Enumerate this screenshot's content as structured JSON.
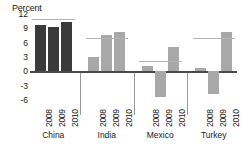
{
  "chart_data": {
    "type": "bar",
    "title": "",
    "ylabel": "Percent",
    "xlabel": "",
    "ylim": [
      -6,
      12
    ],
    "yticks": [
      12,
      9,
      6,
      3,
      0,
      -3,
      -6
    ],
    "grid": false,
    "legend_position": "none",
    "categories": [
      "2008",
      "2009",
      "2010"
    ],
    "groups": [
      {
        "name": "China",
        "color": "#3a3a3a",
        "values": [
          9.6,
          9.2,
          10.4
        ],
        "reference_line": 11.0
      },
      {
        "name": "India",
        "color": "#a8a8a8",
        "values": [
          3.0,
          7.6,
          8.3
        ],
        "reference_line": 7.0
      },
      {
        "name": "Mexico",
        "color": "#a8a8a8",
        "values": [
          1.2,
          -5.3,
          5.0
        ],
        "reference_line": 2.2
      },
      {
        "name": "Turkey",
        "color": "#a8a8a8",
        "values": [
          0.7,
          -4.7,
          8.2
        ],
        "reference_line": 7.0
      }
    ],
    "colors": {
      "highlight_bar": "#3a3a3a",
      "standard_bar": "#a8a8a8",
      "reference_line": "#b4b4b4",
      "axis": "#4a4a4a",
      "text": "#1a1a1a"
    }
  }
}
